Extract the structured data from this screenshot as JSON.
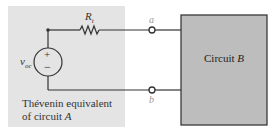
{
  "diagram": {
    "type": "circuit",
    "thevenin_block": {
      "caption_line1": "Thévenin equivalent",
      "caption_line2_prefix": "of circuit ",
      "caption_line2_italic": "A",
      "source_label_main": "v",
      "source_label_sub": "oc",
      "source_plus": "+",
      "source_minus": "−",
      "resistor_label_main": "R",
      "resistor_label_sub": "t",
      "shade_color": "#e4e4e4"
    },
    "terminals": {
      "a": "a",
      "b": "b"
    },
    "circuit_b": {
      "label_prefix": "Circuit ",
      "label_italic": "B",
      "fill_color": "#bdbdbd",
      "border_color": "#3a3a3a"
    },
    "wire_color": "#333333"
  }
}
